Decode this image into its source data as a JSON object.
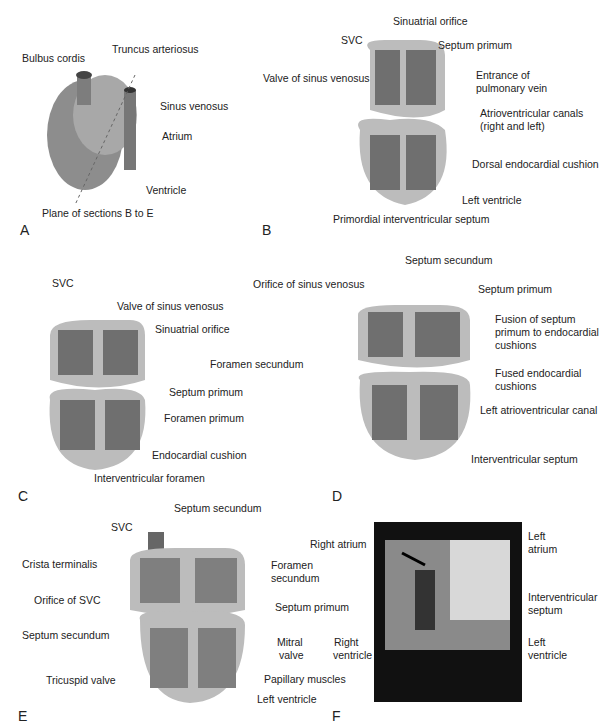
{
  "figure": {
    "panels": [
      {
        "id": "A",
        "labels": [
          "Bulbus cordis",
          "Truncus arteriosus",
          "Sinus venosus",
          "Atrium",
          "Ventricle",
          "Plane of sections B to E"
        ]
      },
      {
        "id": "B",
        "labels": [
          "SVC",
          "Sinuatrial orifice",
          "Septum primum",
          "Valve of sinus venosus",
          "Entrance of",
          "pulmonary vein",
          "Atrioventricular canals",
          "(right and left)",
          "Dorsal endocardial cushion",
          "Left ventricle",
          "Primordial interventricular septum"
        ]
      },
      {
        "id": "C",
        "labels": [
          "SVC",
          "Valve of sinus venosus",
          "Sinuatrial orifice",
          "Foramen secundum",
          "Septum primum",
          "Foramen primum",
          "Endocardial cushion",
          "Interventricular foramen"
        ]
      },
      {
        "id": "D",
        "labels": [
          "Septum secundum",
          "Orifice of sinus venosus",
          "Septum primum",
          "Fusion of septum",
          "primum to endocardial",
          "cushions",
          "Fused endocardial",
          "cushions",
          "Left atrioventricular canal",
          "Interventricular septum"
        ]
      },
      {
        "id": "E",
        "labels": [
          "SVC",
          "Septum secundum",
          "Crista terminalis",
          "Foramen",
          "secundum",
          "Orifice of SVC",
          "Septum primum",
          "Septum secundum",
          "Mitral",
          "valve",
          "Tricuspid valve",
          "Papillary muscles",
          "Left ventricle"
        ]
      },
      {
        "id": "F",
        "labels": [
          "Right atrium",
          "Left",
          "atrium",
          "Interventricular",
          "septum",
          "Right",
          "ventricle",
          "Left",
          "ventricle"
        ]
      }
    ]
  },
  "colors": {
    "tissue": "#a9a9a9",
    "chamber": "#6f6f6f",
    "wall": "#c4c4c4",
    "line": "#333333"
  }
}
